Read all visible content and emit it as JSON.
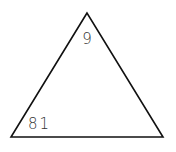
{
  "diagram": {
    "type": "triangle",
    "stroke_color": "#111111",
    "label_color": "#333333",
    "vertices": {
      "top": {
        "x": 87,
        "y": 13
      },
      "bottom_left": {
        "x": 11,
        "y": 137
      },
      "bottom_right": {
        "x": 163,
        "y": 137
      }
    },
    "labels": {
      "top_angle": "9",
      "bottom_left_angle": "81"
    }
  }
}
